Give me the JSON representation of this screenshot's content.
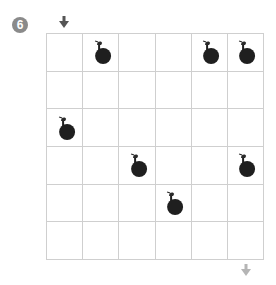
{
  "puzzle": {
    "number": "6",
    "rows": 6,
    "cols": 6,
    "entry": {
      "side": "top",
      "col": 0,
      "icon": "arrow-down-icon",
      "color": "#555555"
    },
    "exit": {
      "side": "bottom",
      "col": 5,
      "icon": "arrow-down-icon",
      "color": "#b5b5b5"
    },
    "bombs": [
      {
        "row": 0,
        "col": 1
      },
      {
        "row": 0,
        "col": 4
      },
      {
        "row": 0,
        "col": 5
      },
      {
        "row": 2,
        "col": 0
      },
      {
        "row": 3,
        "col": 2
      },
      {
        "row": 3,
        "col": 5
      },
      {
        "row": 4,
        "col": 3
      }
    ],
    "colors": {
      "grid_line": "#cfcfcf",
      "bomb": "#1f1f1f",
      "badge": "#8a8a8a"
    }
  }
}
